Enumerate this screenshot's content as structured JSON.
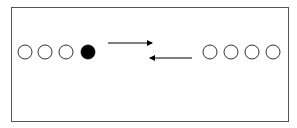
{
  "diagram": {
    "frame": {
      "x": 11,
      "y": 7,
      "width": 277,
      "height": 114,
      "stroke": "#555555"
    },
    "left_group": {
      "circles": [
        {
          "cx": 25,
          "cy": 52,
          "r": 7,
          "filled": false
        },
        {
          "cx": 45,
          "cy": 52,
          "r": 7,
          "filled": false
        },
        {
          "cx": 66,
          "cy": 52,
          "r": 7,
          "filled": false
        },
        {
          "cx": 88,
          "cy": 52,
          "r": 7,
          "filled": true
        }
      ]
    },
    "right_group": {
      "circles": [
        {
          "cx": 210,
          "cy": 52,
          "r": 7,
          "filled": false
        },
        {
          "cx": 231,
          "cy": 52,
          "r": 7,
          "filled": false
        },
        {
          "cx": 252,
          "cy": 52,
          "r": 7,
          "filled": false
        },
        {
          "cx": 273,
          "cy": 52,
          "r": 7,
          "filled": false
        }
      ]
    },
    "arrows": [
      {
        "direction": "right",
        "x1": 108,
        "x2": 152,
        "y": 43
      },
      {
        "direction": "left",
        "x1": 192,
        "x2": 150,
        "y": 58
      }
    ],
    "colors": {
      "stroke": "#000000",
      "fill": "#000000",
      "background": "#ffffff"
    }
  }
}
